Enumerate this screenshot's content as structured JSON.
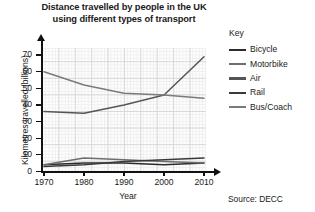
{
  "chart_data": {
    "type": "line",
    "title": "Distance travelled by people in the UK using different types of transport",
    "title_line1": "Distance travelled by people in the UK",
    "title_line2": "using different types of transport",
    "xlabel": "Year",
    "ylabel": "Kilometres travelled (billions)",
    "x": [
      1970,
      1980,
      1990,
      2000,
      2010
    ],
    "xticklabels": [
      "1970",
      "1980",
      "1990",
      "2000",
      "2010"
    ],
    "yticklabels": [
      "0",
      "10",
      "20",
      "30",
      "40",
      "50",
      "60",
      "70"
    ],
    "yticks": [
      0,
      10,
      20,
      30,
      40,
      50,
      60,
      70
    ],
    "xlim": [
      1970,
      2010
    ],
    "ylim": [
      0,
      75
    ],
    "grid": true,
    "legend_position": "right",
    "legend_title": "Key",
    "series": [
      {
        "name": "Bicycle",
        "values": [
          4,
          5,
          5,
          4,
          5
        ],
        "color": "#2b2b2b"
      },
      {
        "name": "Motorbike",
        "values": [
          4,
          8,
          7,
          6,
          5
        ],
        "color": "#6e6e6e"
      },
      {
        "name": "Air",
        "values": [
          36,
          35,
          40,
          46,
          69
        ],
        "color": "#555555"
      },
      {
        "name": "Rail",
        "values": [
          3,
          4,
          6,
          7,
          8
        ],
        "color": "#3a3a3a"
      },
      {
        "name": "Bus/Coach",
        "values": [
          60,
          52,
          47,
          46,
          44
        ],
        "color": "#7a7a7a"
      }
    ],
    "source": "Source: DECC"
  }
}
